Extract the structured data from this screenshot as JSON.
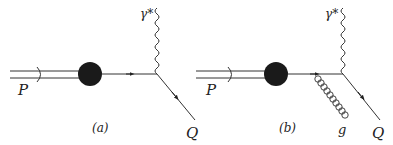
{
  "diagrams": [
    {
      "caption": "(a)",
      "labels": {
        "proton": "P",
        "photon": "γ*",
        "quark": "Q"
      }
    },
    {
      "caption": "(b)",
      "labels": {
        "proton": "P",
        "photon": "γ*",
        "quark": "Q",
        "gluon": "g"
      }
    }
  ],
  "colors": {
    "line": "#333333",
    "blob": "#1a1a1a"
  }
}
